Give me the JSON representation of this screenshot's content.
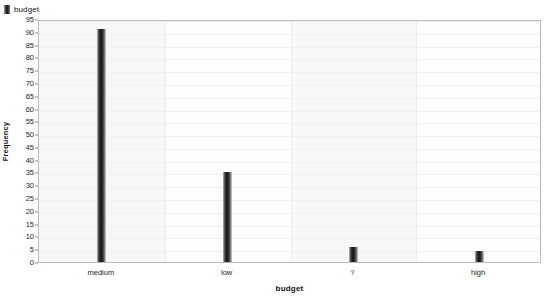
{
  "legend": {
    "position": "top-left",
    "entries": [
      {
        "label": "budget",
        "color": "#1c1c1c",
        "marker": "square-swatch"
      }
    ]
  },
  "chart_data": {
    "type": "bar",
    "title": "",
    "categories": [
      "medium",
      "low",
      "?",
      "high"
    ],
    "values": [
      91,
      35,
      6,
      4.5
    ],
    "series": [
      {
        "name": "budget",
        "values": [
          91,
          35,
          6,
          4.5
        ]
      }
    ],
    "xlabel": "budget",
    "ylabel": "Frequency",
    "ylim": [
      0,
      95
    ],
    "ytick_step": 5,
    "yticks": [
      0,
      5,
      10,
      15,
      20,
      25,
      30,
      35,
      40,
      45,
      50,
      55,
      60,
      65,
      70,
      75,
      80,
      85,
      90,
      95
    ],
    "grid": true,
    "legend_position": "top-left",
    "bar_color": "#1c1c1c"
  },
  "axes": {
    "y_title": "Frequency",
    "x_title": "budget"
  }
}
